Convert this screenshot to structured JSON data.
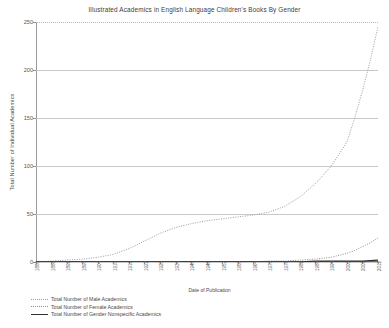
{
  "chart_data": {
    "type": "line",
    "title": "Illustrated Academics in English Language Children's Books By Gender",
    "xlabel": "Date of Publication",
    "ylabel": "Total Number of Individual Academics",
    "ylim": [
      0,
      250
    ],
    "yticks": [
      0,
      50,
      100,
      150,
      200,
      250
    ],
    "grid": true,
    "legend_position": "below-left",
    "xlim": [
      1880,
      2012
    ],
    "categories": [
      1880,
      1886,
      1892,
      1898,
      1904,
      1910,
      1916,
      1922,
      1928,
      1934,
      1940,
      1946,
      1952,
      1958,
      1964,
      1970,
      1976,
      1982,
      1988,
      1994,
      2000,
      2006,
      2012
    ],
    "xtick_labels": [
      "1880",
      "1886",
      "1892",
      "1898",
      "1904",
      "1910",
      "1916",
      "1922",
      "1928",
      "1934",
      "1940",
      "1946",
      "1952",
      "1958",
      "1964",
      "1970",
      "1976",
      "1982",
      "1988",
      "1994",
      "2000",
      "2006",
      "2012"
    ],
    "series": [
      {
        "name": "Total Number of Male Academics",
        "style": "dotted",
        "color": "#9d9d9d",
        "x": [
          1880,
          1886,
          1892,
          1898,
          1904,
          1910,
          1916,
          1922,
          1928,
          1934,
          1940,
          1946,
          1952,
          1958,
          1964,
          1970,
          1976,
          1982,
          1988,
          1994,
          2000,
          2003,
          2006,
          2009,
          2012
        ],
        "values": [
          0,
          1,
          2,
          3,
          5,
          8,
          14,
          22,
          30,
          36,
          40,
          43,
          45,
          47,
          49,
          52,
          58,
          68,
          82,
          100,
          125,
          150,
          178,
          210,
          245
        ]
      },
      {
        "name": "Total Number of Female Academics",
        "style": "dotted",
        "color": "#8d8d8d",
        "x": [
          1880,
          1886,
          1892,
          1898,
          1904,
          1910,
          1916,
          1922,
          1928,
          1934,
          1940,
          1946,
          1952,
          1958,
          1964,
          1970,
          1976,
          1982,
          1988,
          1994,
          2000,
          2003,
          2006,
          2009,
          2012
        ],
        "values": [
          0,
          0,
          0,
          0,
          0,
          0,
          0,
          0,
          0,
          0,
          0,
          0,
          0,
          0,
          0,
          1,
          1,
          2,
          3,
          5,
          9,
          12,
          16,
          20,
          25
        ]
      },
      {
        "name": "Total Number of Gender Nonspecific Academics",
        "style": "solid",
        "color": "#2e2e2e",
        "x": [
          1880,
          1886,
          1892,
          1898,
          1904,
          1910,
          1916,
          1922,
          1928,
          1934,
          1940,
          1946,
          1952,
          1958,
          1964,
          1970,
          1976,
          1982,
          1988,
          1994,
          2000,
          2006,
          2012
        ],
        "values": [
          0,
          0,
          0,
          0,
          0,
          0,
          0,
          0,
          0,
          0,
          0,
          0,
          0,
          0,
          0,
          0,
          0,
          0,
          1,
          1,
          1,
          1,
          2
        ]
      }
    ]
  }
}
